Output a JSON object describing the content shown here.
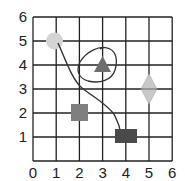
{
  "figure": {
    "type": "coordinate-grid",
    "x_ticks": [
      "0",
      "1",
      "2",
      "3",
      "4",
      "5",
      "6"
    ],
    "y_ticks": [
      "0",
      "1",
      "2",
      "3",
      "4",
      "5",
      "6"
    ],
    "x_range": [
      0,
      6
    ],
    "y_range": [
      0,
      6
    ],
    "grid": true
  },
  "shapes": [
    {
      "name": "circle",
      "x": 1,
      "y": 5,
      "color": "#d4d4d4"
    },
    {
      "name": "triangle",
      "x": 3,
      "y": 4,
      "color": "#6e6e6e",
      "circled": true
    },
    {
      "name": "diamond",
      "x": 5,
      "y": 3,
      "color": "#c8c8c8"
    },
    {
      "name": "square",
      "x": 2,
      "y": 2,
      "color": "#7f7f7f"
    },
    {
      "name": "rectangle",
      "x": 4,
      "y": 1,
      "color": "#4a4a4a"
    }
  ],
  "path": {
    "from": "circle (1,5)",
    "to": "rectangle (4,1)",
    "color": "#333333"
  },
  "colors": {
    "grid": "#222222",
    "background": "#ffffff"
  }
}
